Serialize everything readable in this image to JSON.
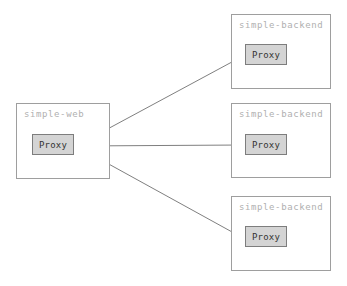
{
  "diagram": {
    "type": "network-topology",
    "canvas": {
      "width": 347,
      "height": 286
    },
    "colors": {
      "background": "#ffffff",
      "container_border": "#9e9e9e",
      "container_label": "#b0b0b0",
      "node_fill": "#d4d4d4",
      "node_border": "#7d7d7d",
      "node_label": "#333333",
      "edge": "#707070"
    },
    "containers": [
      {
        "id": "simple-web",
        "label": "simple-web",
        "x": 16,
        "y": 103,
        "width": 94,
        "height": 76,
        "node": {
          "id": "web-proxy",
          "label": "Proxy",
          "x": 32,
          "y": 134,
          "width": 42,
          "height": 21
        }
      },
      {
        "id": "simple-backend-1",
        "label": "simple-backend",
        "x": 231,
        "y": 14,
        "width": 100,
        "height": 75,
        "node": {
          "id": "backend-proxy-1",
          "label": "Proxy",
          "x": 245,
          "y": 44,
          "width": 42,
          "height": 21
        }
      },
      {
        "id": "simple-backend-2",
        "label": "simple-backend",
        "x": 231,
        "y": 103,
        "width": 100,
        "height": 75,
        "node": {
          "id": "backend-proxy-2",
          "label": "Proxy",
          "x": 245,
          "y": 134,
          "width": 42,
          "height": 21
        }
      },
      {
        "id": "simple-backend-3",
        "label": "simple-backend",
        "x": 231,
        "y": 196,
        "width": 100,
        "height": 75,
        "node": {
          "id": "backend-proxy-3",
          "label": "Proxy",
          "x": 245,
          "y": 226,
          "width": 42,
          "height": 21
        }
      }
    ],
    "edges": [
      {
        "id": "edge-web-to-backend-1",
        "from": "web-proxy",
        "to": "backend-proxy-1",
        "x1": 76,
        "y1": 146,
        "x2": 243,
        "y2": 56,
        "arrowhead": "end"
      },
      {
        "id": "edge-web-to-backend-2",
        "from": "web-proxy",
        "to": "backend-proxy-2",
        "x1": 76,
        "y1": 146,
        "x2": 243,
        "y2": 145,
        "arrowhead": "end"
      },
      {
        "id": "edge-web-to-backend-3",
        "from": "web-proxy",
        "to": "backend-proxy-3",
        "x1": 76,
        "y1": 146,
        "x2": 243,
        "y2": 238,
        "arrowhead": "end"
      }
    ]
  }
}
